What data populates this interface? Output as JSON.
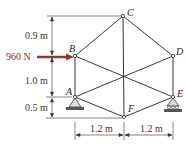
{
  "force": {
    "label": "960 N",
    "color": "#8b3a2e"
  },
  "dimensions": {
    "v1": "0.9 m",
    "v2": "1.0 m",
    "v3": "0.5 m",
    "h1": "1.2 m",
    "h2": "1.2 m"
  },
  "nodes": {
    "A": "A",
    "B": "B",
    "C": "C",
    "D": "D",
    "E": "E",
    "F": "F"
  },
  "supports": {
    "A": "pin",
    "E": "roller"
  }
}
